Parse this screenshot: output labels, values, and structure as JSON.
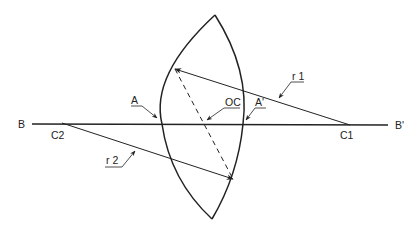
{
  "diagram": {
    "type": "biconvex lens geometry",
    "labels": {
      "axis_left": "B",
      "axis_right": "B'",
      "center_left": "C2",
      "center_right": "C1",
      "vertex_left": "A",
      "vertex_right": "A'",
      "optical_center": "OC",
      "radius_1": "r 1",
      "radius_2": "r 2"
    },
    "colors": {
      "stroke": "#222222",
      "background": "#ffffff"
    }
  }
}
